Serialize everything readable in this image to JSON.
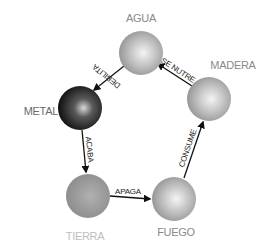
{
  "diagram": {
    "type": "cycle",
    "title": "",
    "nodes": [
      {
        "id": "agua",
        "label": "AGUA",
        "label_color": "#8a8a8a",
        "fill": "light-gray"
      },
      {
        "id": "madera",
        "label": "MADERA",
        "label_color": "#8a8a8a",
        "fill": "light-gray"
      },
      {
        "id": "metal",
        "label": "METAL",
        "label_color": "#6a6a6a",
        "fill": "dark-black"
      },
      {
        "id": "tierra",
        "label": "TIERRA",
        "label_color": "#bdbdbd",
        "fill": "medium-gray"
      },
      {
        "id": "fuego",
        "label": "FUEGO",
        "label_color": "#8a8a8a",
        "fill": "light-gray"
      }
    ],
    "edges": [
      {
        "from": "agua",
        "to": "metal",
        "label": "DEBILITA"
      },
      {
        "from": "madera",
        "to": "agua",
        "label": "SE NUTRE"
      },
      {
        "from": "metal",
        "to": "tierra",
        "label": "ACABA"
      },
      {
        "from": "tierra",
        "to": "fuego",
        "label": "APAGA"
      },
      {
        "from": "fuego",
        "to": "madera",
        "label": "CONSUME"
      }
    ]
  }
}
